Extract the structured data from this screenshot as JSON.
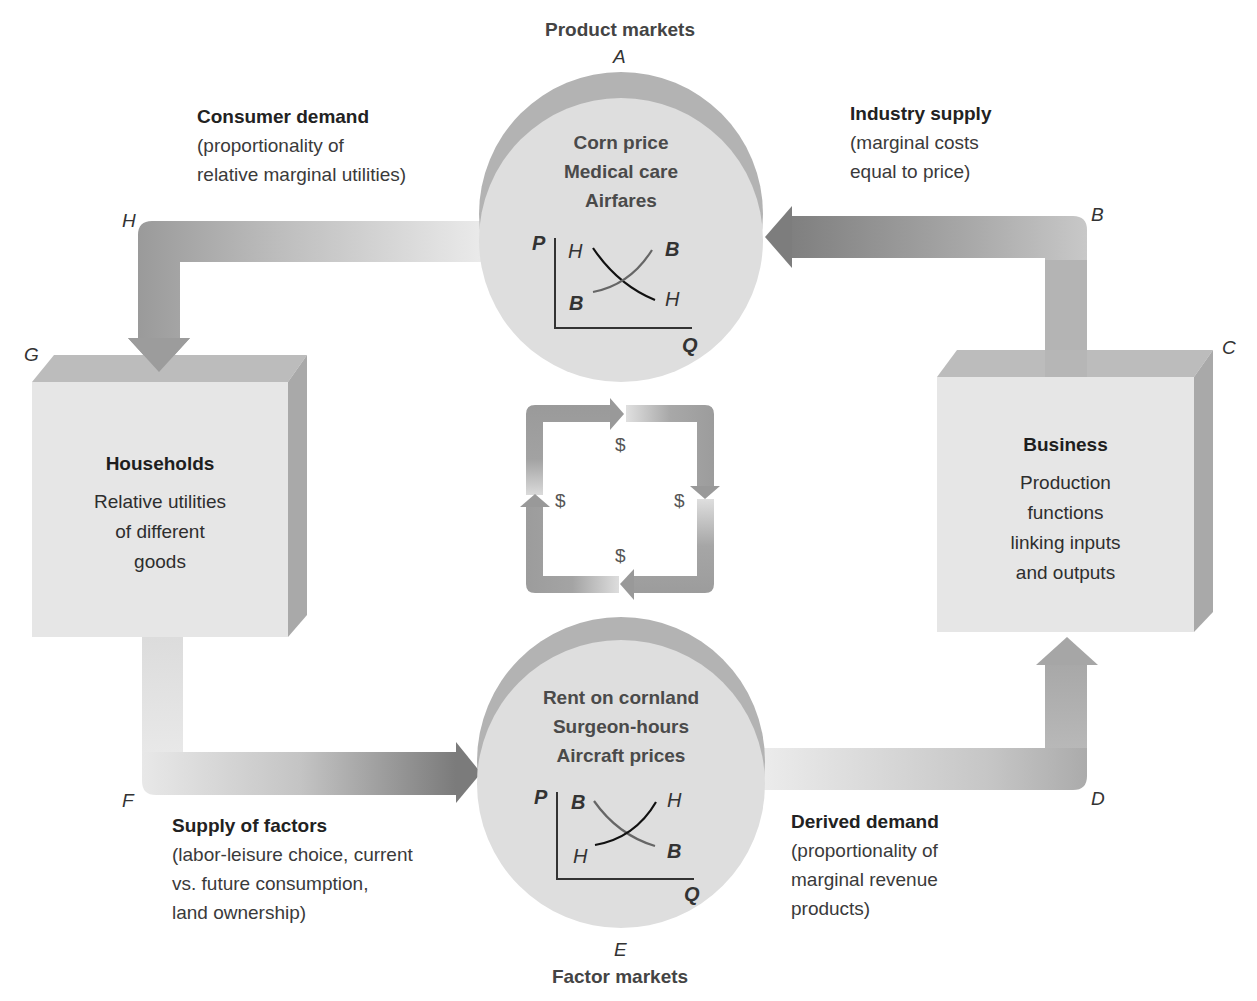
{
  "markets": {
    "product": {
      "title": "Product markets",
      "letter": "A",
      "items": [
        "Corn price",
        "Medical care",
        "Airfares"
      ],
      "graph": {
        "y_axis": "P",
        "x_axis": "Q",
        "curves": [
          {
            "name": "H",
            "shape": "downward-sloping (demand)",
            "start_label": "H",
            "end_label": "H"
          },
          {
            "name": "B",
            "shape": "upward-sloping (supply)",
            "start_label": "B",
            "end_label": "B"
          }
        ]
      }
    },
    "factor": {
      "title": "Factor markets",
      "letter": "E",
      "items": [
        "Rent on cornland",
        "Surgeon-hours",
        "Aircraft prices"
      ],
      "graph": {
        "y_axis": "P",
        "x_axis": "Q",
        "curves": [
          {
            "name": "B",
            "shape": "downward-sloping (demand)",
            "start_label": "B",
            "end_label": "B"
          },
          {
            "name": "H",
            "shape": "upward-sloping (supply)",
            "start_label": "H",
            "end_label": "H"
          }
        ]
      }
    }
  },
  "boxes": {
    "households": {
      "title": "Households",
      "letter": "G",
      "lines": [
        "Relative utilities",
        "of different",
        "goods"
      ]
    },
    "business": {
      "title": "Business",
      "letter": "C",
      "lines": [
        "Production",
        "functions",
        "linking inputs",
        "and outputs"
      ]
    }
  },
  "flows": {
    "consumer_demand": {
      "letter": "H",
      "title": "Consumer demand",
      "lines": [
        "(proportionality of",
        "relative marginal utilities)"
      ]
    },
    "industry_supply": {
      "letter": "B",
      "title": "Industry supply",
      "lines": [
        "(marginal costs",
        "equal to price)"
      ]
    },
    "supply_of_factors": {
      "letter": "F",
      "title": "Supply of factors",
      "lines": [
        "(labor-leisure choice, current",
        "vs. future consumption,",
        "land ownership)"
      ]
    },
    "derived_demand": {
      "letter": "D",
      "title": "Derived demand",
      "lines": [
        "(proportionality of",
        "marginal revenue",
        "products)"
      ]
    }
  },
  "money_loop": {
    "symbol": "$",
    "count": 4
  },
  "colors": {
    "arrow_dark": "#8e8e8e",
    "arrow_light": "#e4e4e4",
    "disc_back": "#b3b3b3",
    "disc_front": "#dedede",
    "box_front": "#e6e6e6",
    "box_top": "#bcbcbc",
    "box_side": "#a9a9a9"
  }
}
